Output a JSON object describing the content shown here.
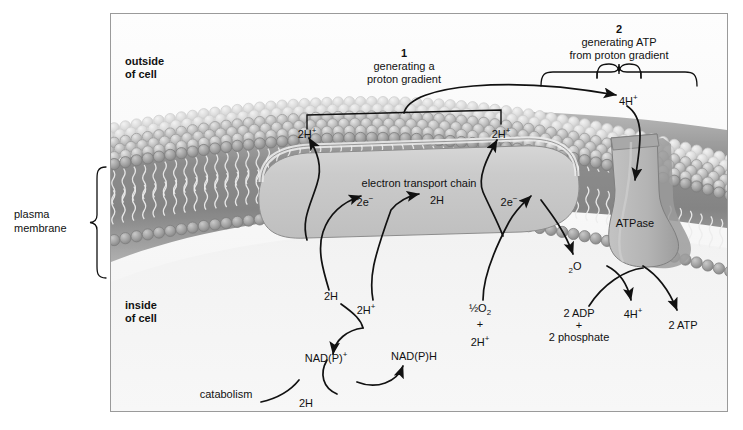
{
  "figure": {
    "title_outside": "outside\nof cell",
    "colors": {
      "frame_border": "#9a9a9a",
      "outside_bg": "#f7f7f7",
      "inside_bg": "#f0f0f0",
      "membrane_head_outer": "#c2c2c2",
      "membrane_head_inner": "#9b9b9b",
      "membrane_core": "#8a8a8a",
      "etc_fill": "#c9c9c9",
      "etc_top": "#d8d8d8",
      "atpase_fill": "#b5b5b5",
      "atpase_shadow": "#8f8f8f",
      "arrow": "#111111"
    }
  },
  "labels": {
    "outside_of_cell_line1": "outside",
    "outside_of_cell_line2": "of  cell",
    "inside_of_cell_line1": "inside",
    "inside_of_cell_line2": "of  cell",
    "plasma_membrane_line1": "plasma",
    "plasma_membrane_line2": "membrane",
    "step1_number": "1",
    "step1_line1": "generating a",
    "step1_line2": "proton gradient",
    "step2_number": "2",
    "step2_line1": "generating ATP",
    "step2_line2": "from proton gradient",
    "etc_title": "electron transport chain",
    "atpase": "ATPase",
    "catabolism": "catabolism"
  },
  "species": {
    "proton_out_left": {
      "main": "2H",
      "sup": "+"
    },
    "proton_out_right": {
      "main": "2H",
      "sup": "+"
    },
    "protons_four_out": {
      "main": "4H",
      "sup": "+"
    },
    "protons_four_in": {
      "main": "4H",
      "sup": "+"
    },
    "electrons_left": {
      "main": "2e",
      "sup": "−"
    },
    "hydrogen_mid": {
      "main": "2H"
    },
    "electrons_right": {
      "main": "2e",
      "sup": "−"
    },
    "proton_in_left": {
      "main": "2H",
      "sup": "+"
    },
    "oxygen_half": {
      "pre": "½",
      "main": "O",
      "sub": "2"
    },
    "plus_sign": "+",
    "proton_in_right": {
      "main": "2H",
      "sup": "+"
    },
    "water": {
      "sub": "2",
      "main": "O"
    },
    "hydrogen_to_nad": {
      "main": "2H"
    },
    "hydrogen_from_catabolism": {
      "main": "2H"
    },
    "nad_oxidized": {
      "main": "NAD(P)",
      "sup": "+"
    },
    "nad_reduced": {
      "main": "NAD(P)H"
    },
    "adp": "2 ADP",
    "adp_plus": "+",
    "phosphate": "2 phosphate",
    "atp": "2 ATP"
  }
}
